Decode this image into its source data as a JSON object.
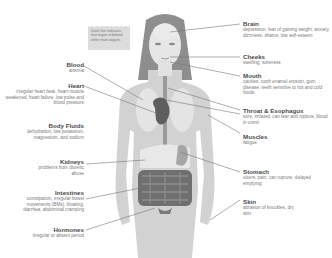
{
  "note": "Dash line indicates that organ is behind other main organs.",
  "labels_left": [
    {
      "title": "Blood",
      "desc": "anemia"
    },
    {
      "title": "Heart",
      "desc": "irregular heart beat, heart muscle weakened, heart failure, low pulse and blood pressure"
    },
    {
      "title": "Body Fluids",
      "desc": "dehydration, low potassium, magnesium, and sodium"
    },
    {
      "title": "Kidneys",
      "desc": "problems from diuretic abuse"
    },
    {
      "title": "Intestines",
      "desc": "constipation, irregular bowel movements (BMs), bloating, diarrhea, abdominal cramping"
    },
    {
      "title": "Hormones",
      "desc": "irregular or absent period"
    }
  ],
  "labels_right": [
    {
      "title": "Brain",
      "desc": "depression, fear of gaining weight, anxiety, dizziness, shame, low self-esteem"
    },
    {
      "title": "Cheeks",
      "desc": "swelling, soreness"
    },
    {
      "title": "Mouth",
      "desc": "cavities, tooth enamel erosion, gum disease, teeth sensitive to hot and cold foods"
    },
    {
      "title": "Throat & Esophagus",
      "desc": "sore, irritated, can tear and rupture, blood in vomit"
    },
    {
      "title": "Muscles",
      "desc": "fatigue"
    },
    {
      "title": "Stomach",
      "desc": "ulcers, pain, can rupture, delayed emptying"
    },
    {
      "title": "Skin",
      "desc": "abrasion of knuckles, dry skin"
    }
  ],
  "colors": {
    "body": "#cfcfcf",
    "hair": "#8a8a8a",
    "organs": "#6e6e6e",
    "lines": "#777777"
  }
}
